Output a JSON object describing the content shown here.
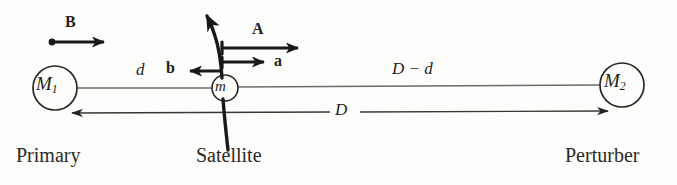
{
  "figure": {
    "background_color": "#fdfdfc",
    "ink_color": "#231f20",
    "thin_line_color": "#6e6b68"
  },
  "bodies": {
    "primary": {
      "symbol": "M",
      "subscript": "1",
      "caption": "Primary",
      "center_x": 55,
      "center_y": 88,
      "radius": 22
    },
    "satellite": {
      "symbol": "m",
      "subscript": "",
      "caption": "Satellite",
      "center_x": 225,
      "center_y": 88,
      "radius": 13
    },
    "perturber": {
      "symbol": "M",
      "subscript": "2",
      "caption": "Perturber",
      "center_x": 622,
      "center_y": 85,
      "radius": 22
    }
  },
  "distances": {
    "primary_to_satellite": "d",
    "satellite_to_perturber": "D − d",
    "primary_to_perturber": "D"
  },
  "vectors": {
    "A": {
      "label": "A",
      "description": "acceleration of satellite due to perturber, long rightward arrow",
      "direction": "right"
    },
    "a": {
      "label": "a",
      "description": "acceleration of primary due to perturber, short rightward arrow",
      "direction": "right"
    },
    "b": {
      "label": "b",
      "description": "differential (tidal) acceleration, leftward arrow",
      "direction": "left"
    },
    "B": {
      "label": "B",
      "description": "reference vector with dot at tail, rightward arrow",
      "direction": "right"
    }
  },
  "orbit": {
    "label": "satellite orbit path",
    "description": "curved trajectory through the satellite, arrowhead at upper left"
  }
}
